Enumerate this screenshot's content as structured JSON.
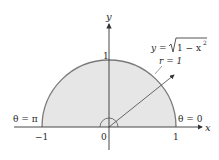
{
  "diagram": {
    "colors": {
      "region_fill": "#e6e6e6",
      "boundary": "#7a7a7a",
      "axes": "#333333",
      "text": "#2a2a2a"
    },
    "axes": {
      "x_label": "x",
      "y_label": "y",
      "ticks": {
        "x_neg_one": "−1",
        "origin": "0",
        "x_one": "1",
        "y_one": "1"
      }
    },
    "annotations": {
      "curve_equation_lhs": "y = ",
      "curve_equation_radicand": "1 − x",
      "curve_equation_exp": "2",
      "radius": "r = 1",
      "theta_left": "θ = π",
      "theta_right": "θ = 0"
    }
  }
}
